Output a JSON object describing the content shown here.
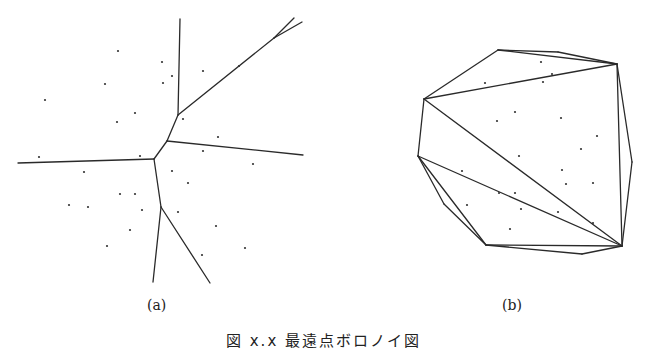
{
  "figure": {
    "caption": "図 x.x 最遠点ボロノイ図",
    "panels": [
      {
        "id": "a",
        "label": "(a)",
        "type": "voronoi",
        "edges": [
          [
            [
              180,
              19
            ],
            [
              178,
              115
            ]
          ],
          [
            [
              178,
              115
            ],
            [
              274,
              38
            ]
          ],
          [
            [
              274,
              38
            ],
            [
              294,
              18
            ]
          ],
          [
            [
              274,
              38
            ],
            [
              302,
              22
            ]
          ],
          [
            [
              178,
              115
            ],
            [
              167,
              141
            ]
          ],
          [
            [
              167,
              141
            ],
            [
              154,
              159
            ]
          ],
          [
            [
              167,
              141
            ],
            [
              303,
              155
            ]
          ],
          [
            [
              154,
              159
            ],
            [
              18,
              163
            ]
          ],
          [
            [
              154,
              159
            ],
            [
              161,
              207
            ]
          ],
          [
            [
              161,
              207
            ],
            [
              153,
              282
            ]
          ],
          [
            [
              161,
              207
            ],
            [
              210,
              283
            ]
          ]
        ],
        "points": [
          [
            118,
            51
          ],
          [
            162,
            62
          ],
          [
            172,
            76
          ],
          [
            163,
            83
          ],
          [
            105,
            84
          ],
          [
            203,
            71
          ],
          [
            239,
            66
          ],
          [
            45,
            100
          ],
          [
            135,
            113
          ],
          [
            117,
            122
          ],
          [
            183,
            119
          ],
          [
            218,
            137
          ],
          [
            203,
            151
          ],
          [
            39,
            157
          ],
          [
            140,
            156
          ],
          [
            253,
            164
          ],
          [
            84,
            172
          ],
          [
            172,
            171
          ],
          [
            188,
            183
          ],
          [
            120,
            194
          ],
          [
            135,
            194
          ],
          [
            69,
            205
          ],
          [
            88,
            207
          ],
          [
            142,
            210
          ],
          [
            178,
            212
          ],
          [
            130,
            230
          ],
          [
            216,
            226
          ],
          [
            107,
            246
          ],
          [
            202,
            255
          ],
          [
            245,
            248
          ]
        ]
      },
      {
        "id": "b",
        "label": "(b)",
        "type": "triangulation",
        "edges": [
          [
            [
              498,
              50
            ],
            [
              558,
              52
            ]
          ],
          [
            [
              558,
              52
            ],
            [
              617,
              64
            ]
          ],
          [
            [
              498,
              50
            ],
            [
              617,
              64
            ]
          ],
          [
            [
              498,
              50
            ],
            [
              424,
              99
            ]
          ],
          [
            [
              424,
              99
            ],
            [
              617,
              64
            ]
          ],
          [
            [
              617,
              64
            ],
            [
              632,
              162
            ]
          ],
          [
            [
              632,
              162
            ],
            [
              622,
              246
            ]
          ],
          [
            [
              617,
              64
            ],
            [
              622,
              246
            ]
          ],
          [
            [
              424,
              99
            ],
            [
              418,
              156
            ]
          ],
          [
            [
              424,
              99
            ],
            [
              622,
              246
            ]
          ],
          [
            [
              418,
              156
            ],
            [
              622,
              246
            ]
          ],
          [
            [
              418,
              156
            ],
            [
              486,
              245
            ]
          ],
          [
            [
              418,
              156
            ],
            [
              444,
              204
            ]
          ],
          [
            [
              444,
              204
            ],
            [
              486,
              245
            ]
          ],
          [
            [
              486,
              245
            ],
            [
              582,
              254
            ]
          ],
          [
            [
              582,
              254
            ],
            [
              622,
              246
            ]
          ],
          [
            [
              486,
              245
            ],
            [
              622,
              246
            ]
          ]
        ],
        "points": [
          [
            541,
            62
          ],
          [
            552,
            74
          ],
          [
            543,
            82
          ],
          [
            485,
            83
          ],
          [
            515,
            112
          ],
          [
            497,
            121
          ],
          [
            561,
            118
          ],
          [
            597,
            136
          ],
          [
            581,
            149
          ],
          [
            519,
            156
          ],
          [
            562,
            170
          ],
          [
            593,
            183
          ],
          [
            566,
            184
          ],
          [
            462,
            171
          ],
          [
            499,
            193
          ],
          [
            515,
            193
          ],
          [
            467,
            205
          ],
          [
            521,
            209
          ],
          [
            558,
            212
          ],
          [
            510,
            229
          ],
          [
            593,
            223
          ]
        ]
      }
    ],
    "colors": {
      "line": "#2a2a2a",
      "point": "#333333",
      "background": "#ffffff"
    }
  }
}
